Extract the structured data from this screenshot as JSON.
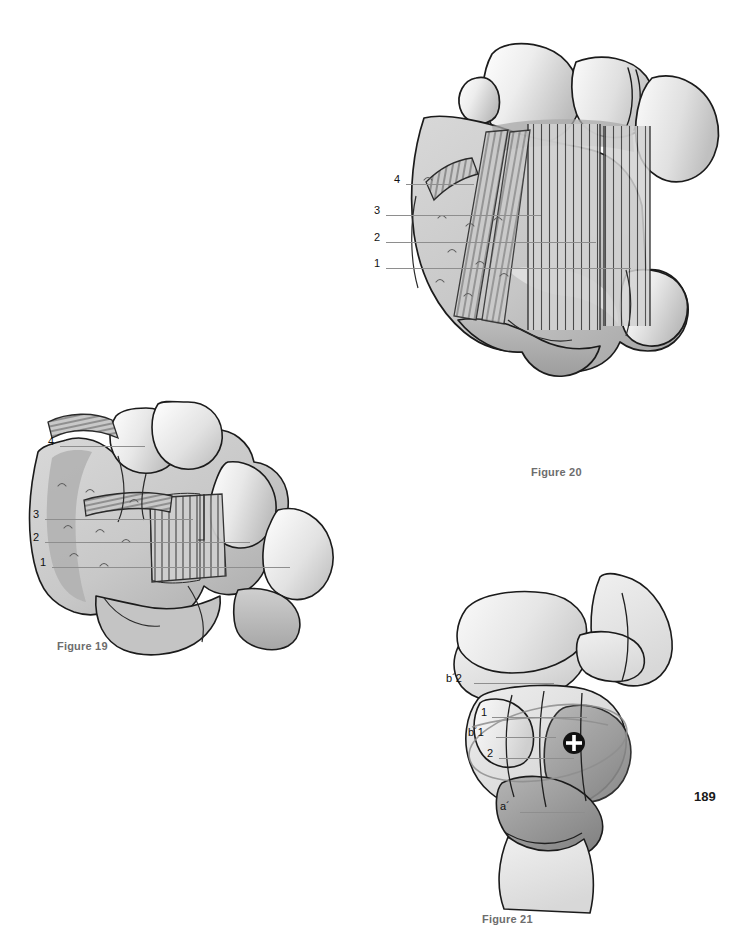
{
  "page": {
    "number": "189",
    "background_color": "#ffffff",
    "text_color": "#111111",
    "caption_color": "#6d6d6d",
    "leader_color": "#8e8e8e",
    "outline_color": "#1b1b1b"
  },
  "palette": {
    "bone_light": "#f4f4f4",
    "bone_mid": "#d6d6d6",
    "bone_shade": "#bdbdbd",
    "bone_dark": "#9a9a9a",
    "bone_darkest": "#808080",
    "ligament_fiber": "#4a4a4a",
    "marker_fill": "#111111",
    "marker_cross": "#ffffff"
  },
  "figures": [
    {
      "id": "figure-19",
      "caption": "Figure 19",
      "labels": [
        {
          "id": "fig19-label-4",
          "text": "4",
          "x": 48,
          "y": 442,
          "leader_x": 60,
          "leader_w": 85
        },
        {
          "id": "fig19-label-3",
          "text": "3",
          "x": 33,
          "y": 515,
          "leader_x": 45,
          "leader_w": 148
        },
        {
          "id": "fig19-label-2",
          "text": "2",
          "x": 33,
          "y": 538,
          "leader_x": 45,
          "leader_w": 205
        },
        {
          "id": "fig19-label-1",
          "text": "1",
          "x": 40,
          "y": 563,
          "leader_x": 52,
          "leader_w": 238
        }
      ]
    },
    {
      "id": "figure-20",
      "caption": "Figure 20",
      "labels": [
        {
          "id": "fig20-label-4",
          "text": "4",
          "x": 394,
          "y": 180,
          "leader_x": 406,
          "leader_w": 68
        },
        {
          "id": "fig20-label-3",
          "text": "3",
          "x": 374,
          "y": 211,
          "leader_x": 386,
          "leader_w": 155
        },
        {
          "id": "fig20-label-2",
          "text": "2",
          "x": 374,
          "y": 238,
          "leader_x": 386,
          "leader_w": 210
        },
        {
          "id": "fig20-label-1",
          "text": "1",
          "x": 374,
          "y": 264,
          "leader_x": 386,
          "leader_w": 245
        }
      ]
    },
    {
      "id": "figure-21",
      "caption": "Figure 21",
      "labels": [
        {
          "id": "fig21-label-b2",
          "text": "b´2",
          "x": 448,
          "y": 679,
          "leader_x": 474,
          "leader_w": 80
        },
        {
          "id": "fig21-label-1",
          "text": "1",
          "x": 481,
          "y": 713,
          "leader_x": 492,
          "leader_w": 95
        },
        {
          "id": "fig21-label-b1",
          "text": "b´1",
          "x": 470,
          "y": 733,
          "leader_x": 496,
          "leader_w": 60
        },
        {
          "id": "fig21-label-2",
          "text": "2",
          "x": 487,
          "y": 754,
          "leader_x": 499,
          "leader_w": 75
        },
        {
          "id": "fig21-label-a",
          "text": "a´",
          "x": 502,
          "y": 808,
          "leader_x": 520,
          "leader_w": 65
        }
      ],
      "markers": [
        {
          "id": "axis-center-marker",
          "type": "crosshair-circle",
          "x": 574,
          "y": 743,
          "r": 11
        }
      ]
    }
  ]
}
